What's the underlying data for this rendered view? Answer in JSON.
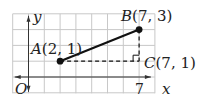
{
  "figure": {
    "type": "coordinate-plane",
    "grid": {
      "x_min": -1,
      "x_max": 8,
      "y_min": -1,
      "y_max": 4,
      "color": "#c8c8c8"
    },
    "axes": {
      "x_label": "x",
      "y_label": "y",
      "origin_label": "O",
      "tick_labels": [
        {
          "axis": "x",
          "value": 7,
          "label": "7"
        }
      ],
      "color": "#333333"
    },
    "points": [
      {
        "name": "A",
        "x": 2,
        "y": 1,
        "label": "A(2, 1)",
        "dot": true
      },
      {
        "name": "B",
        "x": 7,
        "y": 3,
        "label": "B(7, 3)",
        "dot": true
      },
      {
        "name": "C",
        "x": 7,
        "y": 1,
        "label": "C(7, 1)",
        "dot": false
      }
    ],
    "segments": [
      {
        "from": "A",
        "to": "B",
        "style": "solid"
      },
      {
        "from": "A",
        "to": "C",
        "style": "dashed"
      },
      {
        "from": "B",
        "to": "C",
        "style": "dashed"
      }
    ],
    "right_angle_at": "C"
  }
}
